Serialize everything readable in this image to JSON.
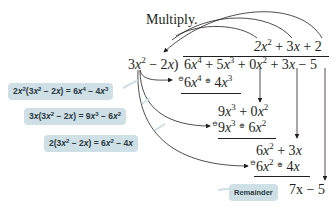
{
  "instruction": "Multiply.",
  "quotient": {
    "t1": "2x",
    "t1_exp": "2",
    "rest": " + 3x + 2"
  },
  "divisor": "3x² − 2x",
  "dividend": "6x⁴ + 5x³ + 0x² + 3x − 5",
  "steps": [
    {
      "sub_line": "6x⁴ − 4x³",
      "signs": [
        "⊖",
        "⊕"
      ]
    },
    {
      "bring_down": "9x³ + 0x²",
      "sub_line": "9x³ − 6x²",
      "signs": [
        "⊖",
        "⊕"
      ]
    },
    {
      "bring_down": "6x² + 3x",
      "sub_line": "6x² − 4x",
      "signs": [
        "⊖",
        "⊕"
      ]
    }
  ],
  "remainder": "7x − 5",
  "callouts": [
    {
      "text": "2x²(3x² − 2x) = 6x⁴ − 4x³"
    },
    {
      "text": "3x(3x² − 2x) = 9x³ − 6x²"
    },
    {
      "text": "2(3x² − 2x) = 6x² − 4x"
    },
    {
      "text": "Remainder"
    }
  ],
  "colors": {
    "callout_bg": "#cfdfe6",
    "ink": "#231f20"
  }
}
